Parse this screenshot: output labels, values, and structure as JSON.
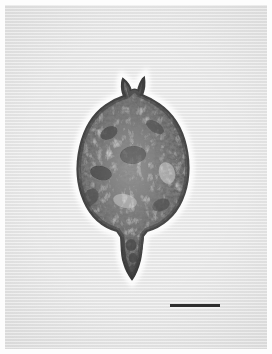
{
  "figure": {
    "kind": "light-micrograph",
    "caption": "",
    "panel_label": ""
  },
  "panel": {
    "background_color": "#e3e3e3",
    "border_color": "#ffffff",
    "width_px": 262,
    "height_px": 344,
    "texture": "horizontal-scanlines"
  },
  "specimen": {
    "name": "microorganism",
    "description": "dark granular ovoid cell with two apical horns and a tapering antapical spine",
    "outline_color": "#1a1a1a",
    "halo_color": "#fbfbfb",
    "fill_color": "#4a4a4a",
    "center_x_px": 130,
    "body_top_y_px": 92,
    "body_bottom_y_px": 220,
    "body_width_px": 112,
    "horn_top_y_px": 73,
    "tail_tip_y_px": 273
  },
  "scale_bar": {
    "label": "",
    "length_px": 50,
    "thickness_px": 3,
    "color": "#2e2e2e",
    "x_px": 170,
    "y_px": 304
  }
}
